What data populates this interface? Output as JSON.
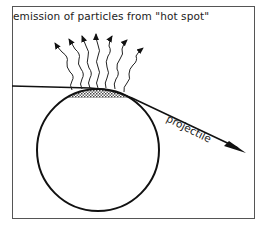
{
  "diagram": {
    "caption": "emission of particles from \"hot spot\"",
    "projectile_label": "projectile",
    "elements": {
      "target_nucleus": {
        "shape": "circle",
        "cx": 98,
        "cy": 150,
        "r": 61
      },
      "hot_spot": {
        "shape": "shaded-cap",
        "fill": "dotted-gray"
      },
      "projectile_trajectory": {
        "from": [
          12,
          86
        ],
        "tangent_at": [
          100,
          88
        ],
        "to": [
          246,
          152
        ],
        "arrowhead": true
      },
      "emitted_particles": {
        "count": 7,
        "style": "wavy-arrow"
      }
    },
    "colors": {
      "line": "#111111",
      "frame": "#555555",
      "shading": "#9a9a9a"
    }
  }
}
